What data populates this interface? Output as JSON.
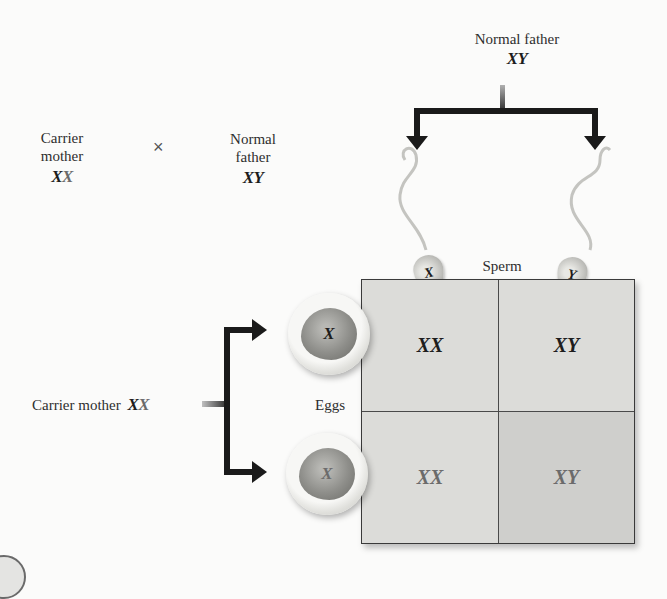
{
  "cross": {
    "mother_label_line1": "Carrier",
    "mother_label_line2": "mother",
    "mother_genotype": [
      "X",
      "X"
    ],
    "times_symbol": "×",
    "father_label_line1": "Normal",
    "father_label_line2": "father",
    "father_genotype": [
      "X",
      "Y"
    ]
  },
  "father_source": {
    "label": "Normal father",
    "genotype": [
      "X",
      "Y"
    ]
  },
  "mother_source": {
    "label": "Carrier mother",
    "genotype": [
      "X",
      "X"
    ]
  },
  "gametes": {
    "sperm_label": "Sperm",
    "eggs_label": "Eggs",
    "sperm": [
      "X",
      "Y"
    ],
    "eggs": [
      "X",
      "X"
    ]
  },
  "punnett": {
    "cells": [
      [
        "XX",
        "XY"
      ],
      [
        "XX",
        "XY"
      ]
    ]
  },
  "colors": {
    "normal_allele": "#1d1d1d",
    "carrier_allele": "#6b6b6b",
    "grid_fill": "#dcdcd9",
    "affected_cell_fill": "#cfcfcc",
    "arrow": "#1a1a1a"
  }
}
